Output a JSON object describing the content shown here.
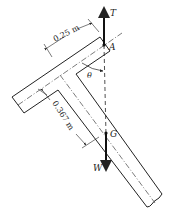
{
  "diagram": {
    "type": "free-body diagram of T-shaped bar suspended at A",
    "labels": {
      "tension": "T",
      "point_a": "A",
      "angle": "θ",
      "center_of_gravity": "G",
      "weight": "W"
    },
    "dimensions": {
      "crossbar_half_length": "0.25 m",
      "g_distance": "0.367 m"
    },
    "colors": {
      "stroke": "#222222",
      "background": "#ffffff"
    }
  }
}
